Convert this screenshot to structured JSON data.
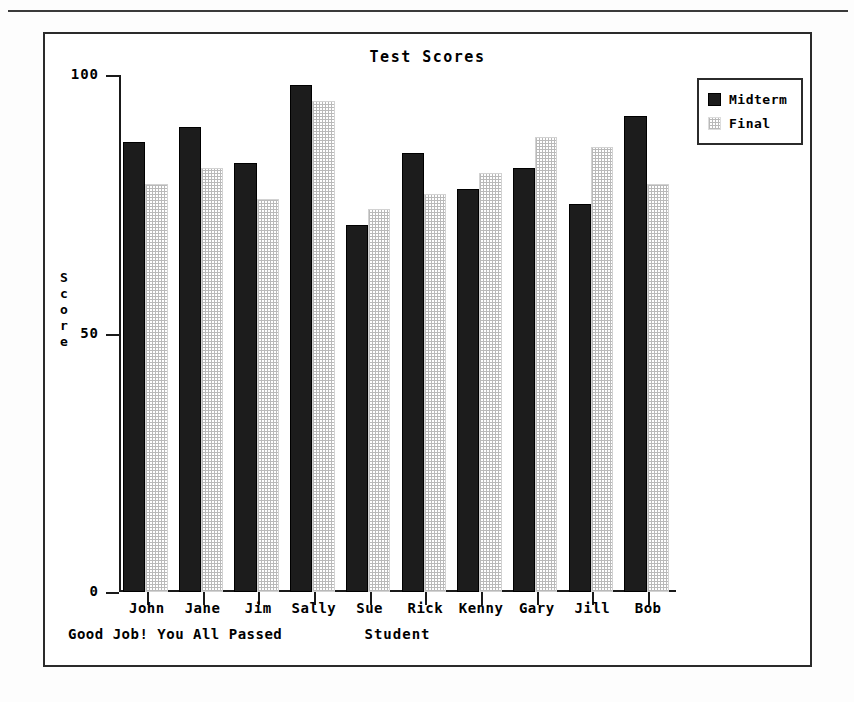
{
  "chart_data": {
    "type": "bar",
    "title": "Test Scores",
    "xlabel": "Student",
    "ylabel": "Score",
    "categories": [
      "John",
      "Jane",
      "Jim",
      "Sally",
      "Sue",
      "Rick",
      "Kenny",
      "Gary",
      "Jill",
      "Bob"
    ],
    "series": [
      {
        "name": "Midterm",
        "values": [
          87,
          90,
          83,
          98,
          71,
          85,
          78,
          82,
          75,
          92
        ]
      },
      {
        "name": "Final",
        "values": [
          79,
          82,
          76,
          95,
          74,
          77,
          81,
          88,
          86,
          79
        ]
      }
    ],
    "ylim": [
      0,
      100
    ],
    "yticks": [
      0,
      50,
      100
    ],
    "ytick_labels": [
      "0",
      "50",
      "100"
    ],
    "grid": false,
    "legend_position": "upper-right-outside",
    "annotation": "Good Job! You All Passed"
  },
  "legend": {
    "entries": [
      {
        "label": "Midterm",
        "swatch": "solid-dark-swatch",
        "color": "#1c1c1c"
      },
      {
        "label": "Final",
        "swatch": "stippled-light-swatch",
        "color": "#b9b9b9"
      }
    ]
  }
}
